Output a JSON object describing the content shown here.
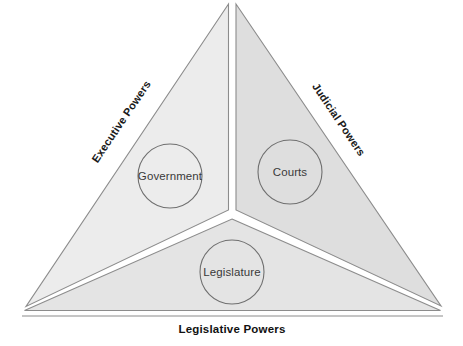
{
  "diagram": {
    "type": "separation-of-powers-triangle",
    "segments": [
      {
        "id": "executive",
        "edge_label": "Executive Powers",
        "node_label": "Government",
        "fill": "#ececec",
        "stroke": "#8c8c8c",
        "position": "left"
      },
      {
        "id": "judicial",
        "edge_label": "Judicial Powers",
        "node_label": "Courts",
        "fill": "#dedede",
        "stroke": "#8c8c8c",
        "position": "right"
      },
      {
        "id": "legislative",
        "edge_label": "Legislative Powers",
        "node_label": "Legislature",
        "fill": "#e4e4e4",
        "stroke": "#8c8c8c",
        "position": "bottom"
      }
    ],
    "geometry": {
      "apex": [
        232,
        3
      ],
      "bottom_left": [
        23,
        308
      ],
      "bottom_right": [
        443,
        308
      ],
      "centroid": [
        232,
        216
      ],
      "circle_radius": 32,
      "government_center": [
        170,
        176
      ],
      "courts_center": [
        290,
        172
      ],
      "legislature_center": [
        232,
        272
      ],
      "base_rule_y": 316
    },
    "labels": {
      "executive_rotation": -56,
      "judicial_rotation": 56,
      "legislative_rotation": 0
    },
    "colors": {
      "background": "#ffffff",
      "divider": "#ffffff",
      "outline": "#8c8c8c",
      "node_text": "#3a3a3a",
      "edge_text": "#1a1a1a"
    }
  }
}
